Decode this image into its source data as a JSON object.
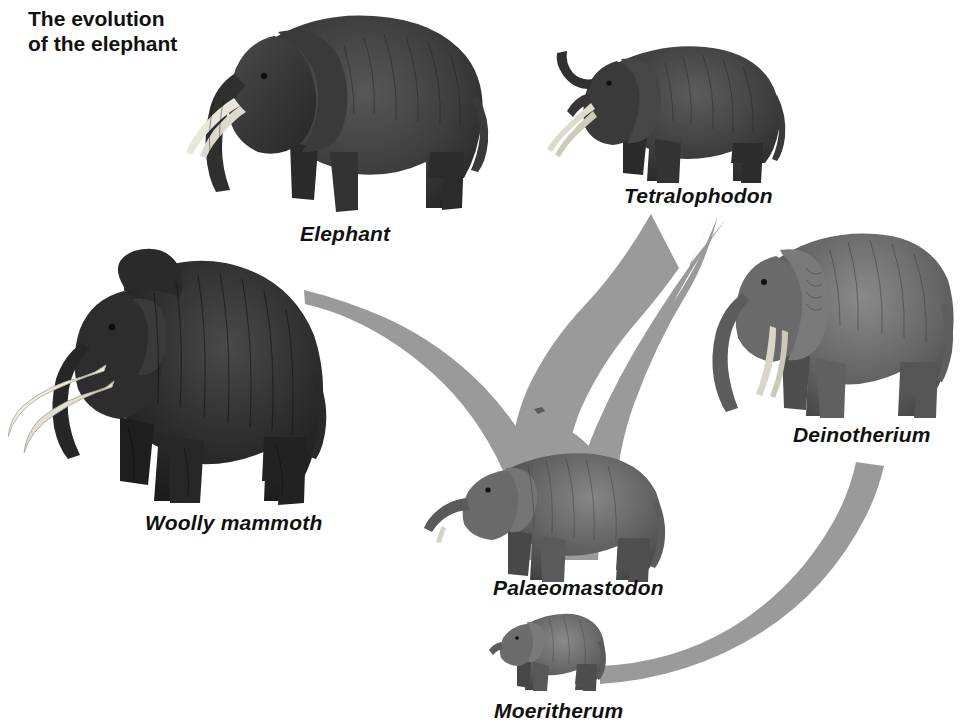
{
  "figure": {
    "title": "The evolution\nof the elephant",
    "background_color": "#ffffff",
    "width": 961,
    "height": 728
  },
  "palette": {
    "arrow_gray": "#9a9a9a",
    "text_black": "#111111",
    "animal_dark": "#3a3a3a",
    "animal_mid": "#6e6e6e",
    "tusk_white": "#f2f0ea"
  },
  "diagram": {
    "type": "evolutionary-tree",
    "root": "Moeritherum",
    "nodes": [
      {
        "id": "elephant",
        "label": "Elephant",
        "caption_position": {
          "x": 300,
          "y": 222
        },
        "image_box": {
          "x": 178,
          "y": 2,
          "w": 316,
          "h": 218
        },
        "facing": "left",
        "tone": "dark"
      },
      {
        "id": "tetralophodon",
        "label": "Tetralophodon",
        "caption_position": {
          "x": 624,
          "y": 184
        },
        "image_box": {
          "x": 543,
          "y": 33,
          "w": 250,
          "h": 155
        },
        "facing": "left",
        "tone": "dark"
      },
      {
        "id": "deinotherium",
        "label": "Deinotherium",
        "caption_position": {
          "x": 793,
          "y": 423
        },
        "image_box": {
          "x": 698,
          "y": 222,
          "w": 262,
          "h": 200
        },
        "facing": "left",
        "tone": "mid"
      },
      {
        "id": "woolly-mammoth",
        "label": "Woolly mammoth",
        "caption_position": {
          "x": 145,
          "y": 511
        },
        "image_box": {
          "x": 8,
          "y": 247,
          "w": 340,
          "h": 262
        },
        "facing": "left",
        "tone": "very-dark"
      },
      {
        "id": "palaeomastodon",
        "label": "Palaeomastodon",
        "caption_position": {
          "x": 493,
          "y": 576
        },
        "image_box": {
          "x": 418,
          "y": 448,
          "w": 256,
          "h": 135
        },
        "facing": "left",
        "tone": "mid"
      },
      {
        "id": "moeritherum",
        "label": "Moeritherum",
        "caption_position": {
          "x": 494,
          "y": 699
        },
        "image_box": {
          "x": 487,
          "y": 608,
          "w": 126,
          "h": 84
        },
        "facing": "left",
        "tone": "mid"
      }
    ],
    "connections": [
      {
        "from": "palaeomastodon",
        "to": "elephant",
        "style": "gray-tapered-branch"
      },
      {
        "from": "palaeomastodon",
        "to": "woolly-mammoth",
        "style": "gray-tapered-branch"
      },
      {
        "from": "palaeomastodon",
        "to": "tetralophodon",
        "style": "gray-tapered-branch"
      },
      {
        "from": "moeritherum",
        "to": "deinotherium",
        "style": "gray-curved-band"
      }
    ]
  }
}
